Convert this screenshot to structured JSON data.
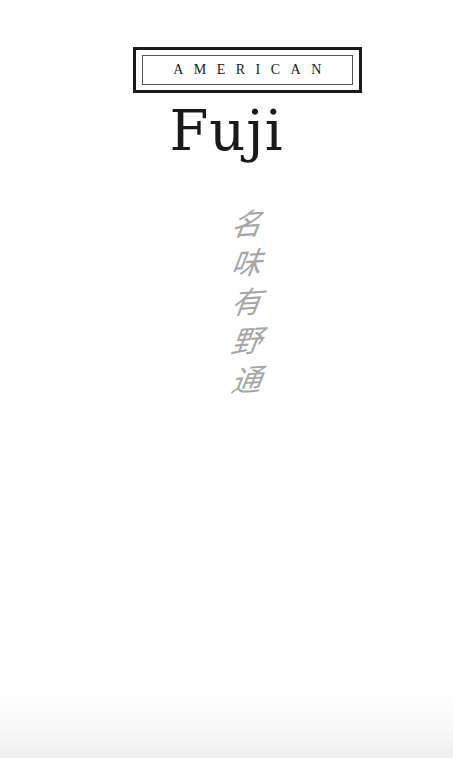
{
  "page": {
    "series_label": "AMERICAN",
    "title": "Fuji",
    "inscription": {
      "characters": [
        "名",
        "味",
        "有",
        "野",
        "通"
      ],
      "color": "#a6a6a6",
      "orientation": "vertical"
    }
  },
  "colors": {
    "text": "#1a1a1a",
    "background": "#ffffff"
  }
}
